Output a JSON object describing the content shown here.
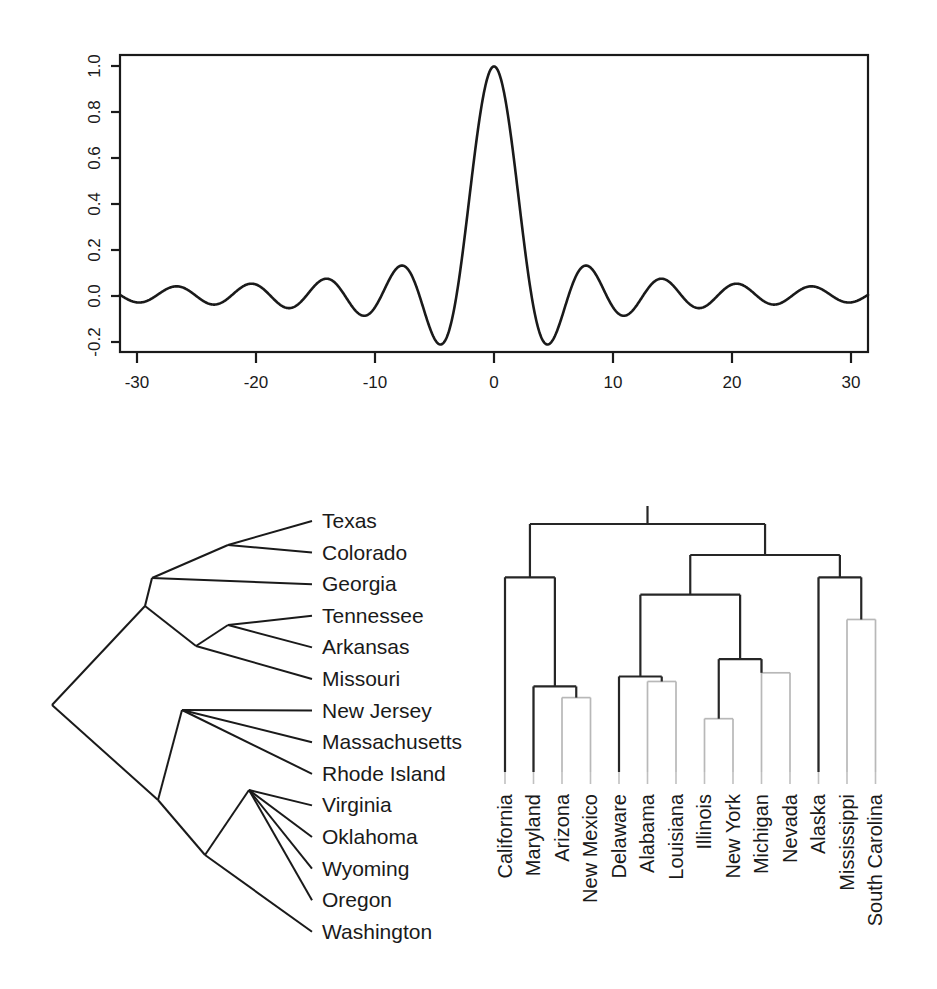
{
  "page": {
    "background": "#ffffff",
    "ink": "#1a1a1a",
    "stem_color": "#b8b8b8",
    "width": 937,
    "height": 989
  },
  "chart_data": [
    {
      "id": "sinc-plot",
      "type": "line",
      "title": "",
      "xlabel": "",
      "ylabel": "",
      "grid": false,
      "legend": null,
      "xlim": [
        -31.4159,
        31.4159
      ],
      "ylim": [
        -0.25,
        1.05
      ],
      "xticks": [
        -30,
        -20,
        -10,
        0,
        10,
        20,
        30
      ],
      "xtick_labels": [
        "-30",
        "-20",
        "-10",
        "0",
        "10",
        "20",
        "30"
      ],
      "yticks": [
        -0.2,
        0.0,
        0.2,
        0.4,
        0.6,
        0.8,
        1.0
      ],
      "ytick_labels": [
        "-0.2",
        "0.0",
        "0.2",
        "0.4",
        "0.6",
        "0.8",
        "1.0"
      ],
      "function": "sin(x)/x",
      "description": "sinc function, peak 1.0 at x=0, zero crossings at multiples of pi, first side minima -0.217 at x=+/-4.493",
      "key_points": [
        {
          "x": 0,
          "y": 1.0
        },
        {
          "x": 4.493,
          "y": -0.217
        },
        {
          "x": -4.493,
          "y": -0.217
        },
        {
          "x": 7.725,
          "y": 0.128
        },
        {
          "x": -7.725,
          "y": 0.128
        },
        {
          "x": 10.904,
          "y": -0.091
        },
        {
          "x": 14.066,
          "y": 0.071
        },
        {
          "x": 17.221,
          "y": -0.058
        },
        {
          "x": 20.371,
          "y": 0.049
        },
        {
          "x": 23.519,
          "y": -0.043
        },
        {
          "x": 26.666,
          "y": 0.037
        },
        {
          "x": 29.812,
          "y": -0.034
        }
      ]
    },
    {
      "id": "phylogram-tree",
      "type": "tree",
      "layout": "slanted-cladogram",
      "leaves": [
        "Texas",
        "Colorado",
        "Georgia",
        "Tennessee",
        "Arkansas",
        "Missouri",
        "New Jersey",
        "Massachusetts",
        "Rhode Island",
        "Virginia",
        "Oklahoma",
        "Wyoming",
        "Oregon",
        "Washington"
      ],
      "clusters": [
        {
          "name": "cluster-a",
          "members": [
            "Texas",
            "Colorado"
          ]
        },
        {
          "name": "cluster-b",
          "members": [
            "Texas",
            "Colorado",
            "Georgia"
          ]
        },
        {
          "name": "cluster-c",
          "members": [
            "Tennessee",
            "Arkansas"
          ]
        },
        {
          "name": "cluster-d",
          "members": [
            "Tennessee",
            "Arkansas",
            "Missouri"
          ]
        },
        {
          "name": "cluster-e",
          "members": [
            "New Jersey",
            "Massachusetts",
            "Rhode Island"
          ]
        },
        {
          "name": "cluster-f",
          "members": [
            "Virginia",
            "Oklahoma",
            "Wyoming",
            "Oregon"
          ]
        },
        {
          "name": "cluster-g",
          "members": [
            "Virginia",
            "Oklahoma",
            "Wyoming",
            "Oregon",
            "Washington"
          ]
        }
      ]
    },
    {
      "id": "dendrogram",
      "type": "tree",
      "layout": "rectangular-dendrogram",
      "leaves": [
        "California",
        "Maryland",
        "Arizona",
        "New Mexico",
        "Delaware",
        "Alabama",
        "Louisiana",
        "Illinois",
        "New York",
        "Michigan",
        "Nevada",
        "Alaska",
        "Mississippi",
        "South Carolina"
      ],
      "merge_color": "#262626",
      "stem_color": "#b8b8b8",
      "merges": [
        {
          "pair": [
            "Arizona",
            "New Mexico"
          ],
          "height": 0.3
        },
        {
          "pair": [
            "Maryland",
            "Arizona+New Mexico"
          ],
          "height": 0.34
        },
        {
          "pair": [
            "California",
            "Maryland-cluster"
          ],
          "height": 0.78
        },
        {
          "pair": [
            "Alabama",
            "Louisiana"
          ],
          "height": 0.37
        },
        {
          "pair": [
            "Delaware",
            "Alabama+Louisiana"
          ],
          "height": 0.38
        },
        {
          "pair": [
            "Illinois",
            "New York"
          ],
          "height": 0.21
        },
        {
          "pair": [
            "Illinois+New York",
            "Michigan"
          ],
          "height": 0.46
        },
        {
          "pair": [
            "Delaware-cluster",
            "Illinois-cluster"
          ],
          "height": 0.72
        },
        {
          "pair": [
            "Alaska",
            "Mississippi+South Carolina"
          ],
          "height": 0.78
        },
        {
          "pair": [
            "Mississippi",
            "South Carolina"
          ],
          "height": 0.62
        },
        {
          "pair": [
            "Delaware/Illinois-cluster",
            "Alaska-cluster"
          ],
          "height": 0.88
        },
        {
          "pair": [
            "California-cluster",
            "right-cluster"
          ],
          "height": 0.97
        }
      ]
    }
  ]
}
